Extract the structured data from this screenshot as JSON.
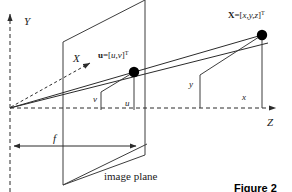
{
  "figure": {
    "caption": "Figure 2",
    "image_plane_label": "image plane",
    "background_color": "#ffffff",
    "line_color": "#2b2b2b",
    "plane_color": "#3d3d3d",
    "dot_color": "#000000"
  },
  "axes": {
    "y_label": "Y",
    "z_label": "Z",
    "x_label": "X",
    "origin": {
      "x": 10,
      "y": 108
    }
  },
  "points": {
    "world_point": {
      "name": "X",
      "equals": "=[",
      "components": "x,y,z",
      "close": "]",
      "transpose": "T",
      "dot": {
        "x": 262,
        "y": 35
      }
    },
    "image_point": {
      "name": "u",
      "equals": "=[",
      "components": "u,v",
      "close": "]",
      "transpose": "T",
      "dot": {
        "x": 134,
        "y": 72
      }
    }
  },
  "measures": {
    "focal_length": "f",
    "image_u": "u",
    "image_v": "v",
    "world_x": "x",
    "world_y": "y"
  },
  "geometry": {
    "image_plane_polygon": "63,42 145,0 145,155 63,185",
    "small_rect_polygon": "101,92 134,72 134,110 101,110",
    "large_rect_polygon": "200,75 262,35 262,108 200,108",
    "ray_to_world": "10,108 262,35",
    "ray_lower": "10,108 262,42",
    "x_axis_dashed": "10,108 92,62",
    "z_axis": "10,108 278,108",
    "y_axis": "10,190 10,12",
    "focal_arrow": "12,146 140,146",
    "world_drop_line": "262,35 262,108",
    "image_drop_line": "134,72 134,110",
    "label_leader": "97,162 140,140"
  }
}
